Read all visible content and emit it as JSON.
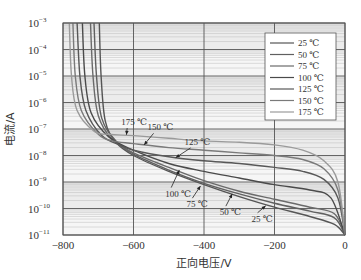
{
  "chart_data": {
    "type": "line",
    "title": "",
    "xlabel": "正向电压/V",
    "ylabel": "电流/A",
    "xlim": [
      -800,
      0
    ],
    "ylim": [
      1e-11,
      0.001
    ],
    "yscale": "log",
    "grid": true,
    "legend_position": "upper right",
    "x_ticks": [
      -800,
      -600,
      -400,
      -200,
      0
    ],
    "x_tick_labels": [
      "−800",
      "−600",
      "−400",
      "−200",
      "0"
    ],
    "y_ticks_exp": [
      -3,
      -4,
      -5,
      -6,
      -7,
      -8,
      -9,
      -10,
      -11
    ],
    "y_tick_base": "10",
    "series": [
      {
        "name": "25 ℃",
        "color": "#555555",
        "points": [
          [
            -697,
            -3
          ],
          [
            -692,
            -5
          ],
          [
            -680,
            -6.7
          ],
          [
            -650,
            -7.5
          ],
          [
            -600,
            -8.0
          ],
          [
            -500,
            -8.6
          ],
          [
            -400,
            -9.1
          ],
          [
            -300,
            -9.55
          ],
          [
            -200,
            -9.95
          ],
          [
            -100,
            -10.3
          ],
          [
            -30,
            -10.6
          ],
          [
            0,
            -11
          ]
        ]
      },
      {
        "name": "50 ℃",
        "color": "#606060",
        "points": [
          [
            -712,
            -3
          ],
          [
            -705,
            -5
          ],
          [
            -690,
            -6.6
          ],
          [
            -650,
            -7.45
          ],
          [
            -600,
            -7.95
          ],
          [
            -500,
            -8.55
          ],
          [
            -400,
            -9.05
          ],
          [
            -300,
            -9.45
          ],
          [
            -200,
            -9.8
          ],
          [
            -100,
            -10.1
          ],
          [
            -30,
            -10.35
          ],
          [
            0,
            -11
          ]
        ]
      },
      {
        "name": "75 ℃",
        "color": "#6a6a6a",
        "points": [
          [
            -722,
            -3
          ],
          [
            -715,
            -5
          ],
          [
            -700,
            -6.5
          ],
          [
            -660,
            -7.4
          ],
          [
            -600,
            -7.9
          ],
          [
            -500,
            -8.45
          ],
          [
            -400,
            -8.95
          ],
          [
            -300,
            -9.35
          ],
          [
            -200,
            -9.65
          ],
          [
            -100,
            -9.95
          ],
          [
            -30,
            -10.2
          ],
          [
            0,
            -11
          ]
        ]
      },
      {
        "name": "100 ℃",
        "color": "#4a4a4a",
        "points": [
          [
            -745,
            -3
          ],
          [
            -738,
            -5
          ],
          [
            -720,
            -6.4
          ],
          [
            -670,
            -7.3
          ],
          [
            -600,
            -7.8
          ],
          [
            -500,
            -8.3
          ],
          [
            -400,
            -8.6
          ],
          [
            -300,
            -8.85
          ],
          [
            -200,
            -9.1
          ],
          [
            -100,
            -9.3
          ],
          [
            -40,
            -9.6
          ],
          [
            0,
            -11
          ]
        ]
      },
      {
        "name": "125 ℃",
        "color": "#585858",
        "points": [
          [
            -760,
            -3
          ],
          [
            -752,
            -5
          ],
          [
            -735,
            -6.3
          ],
          [
            -690,
            -7.25
          ],
          [
            -640,
            -7.6
          ],
          [
            -600,
            -7.8
          ],
          [
            -500,
            -8.05
          ],
          [
            -400,
            -8.2
          ],
          [
            -300,
            -8.3
          ],
          [
            -200,
            -8.45
          ],
          [
            -120,
            -8.6
          ],
          [
            -60,
            -8.9
          ],
          [
            -20,
            -9.6
          ],
          [
            0,
            -11
          ]
        ]
      },
      {
        "name": "150 ℃",
        "color": "#7a7a7a",
        "points": [
          [
            -772,
            -3
          ],
          [
            -765,
            -5
          ],
          [
            -748,
            -6.3
          ],
          [
            -700,
            -7.2
          ],
          [
            -660,
            -7.45
          ],
          [
            -600,
            -7.55
          ],
          [
            -500,
            -7.7
          ],
          [
            -400,
            -7.8
          ],
          [
            -300,
            -7.9
          ],
          [
            -200,
            -8.0
          ],
          [
            -120,
            -8.15
          ],
          [
            -60,
            -8.5
          ],
          [
            -20,
            -9.3
          ],
          [
            0,
            -11
          ]
        ]
      },
      {
        "name": "175 ℃",
        "color": "#9a9a9a",
        "points": [
          [
            -782,
            -3
          ],
          [
            -776,
            -5
          ],
          [
            -760,
            -6.3
          ],
          [
            -710,
            -7.1
          ],
          [
            -670,
            -7.2
          ],
          [
            -600,
            -7.25
          ],
          [
            -500,
            -7.35
          ],
          [
            -400,
            -7.45
          ],
          [
            -300,
            -7.5
          ],
          [
            -200,
            -7.6
          ],
          [
            -120,
            -7.8
          ],
          [
            -60,
            -8.2
          ],
          [
            -20,
            -9.0
          ],
          [
            0,
            -11
          ]
        ]
      }
    ],
    "annotations": [
      {
        "text": "175 ℃",
        "label_xy": [
          -635,
          -6.85
        ],
        "arrow_to": [
          -620,
          -7.22
        ]
      },
      {
        "text": "150 ℃",
        "label_xy": [
          -560,
          -7.05
        ],
        "arrow_to": [
          -570,
          -7.6
        ]
      },
      {
        "text": "125 ℃",
        "label_xy": [
          -455,
          -7.6
        ],
        "arrow_to": [
          -480,
          -8.08
        ]
      },
      {
        "text": "100 ℃",
        "label_xy": [
          -510,
          -9.55
        ],
        "arrow_to": [
          -470,
          -8.55
        ]
      },
      {
        "text": "75 ℃",
        "label_xy": [
          -450,
          -9.95
        ],
        "arrow_to": [
          -410,
          -9.15
        ]
      },
      {
        "text": "50 ℃",
        "label_xy": [
          -355,
          -10.25
        ],
        "arrow_to": [
          -320,
          -9.45
        ]
      },
      {
        "text": "25 ℃",
        "label_xy": [
          -265,
          -10.5
        ],
        "arrow_to": [
          -225,
          -9.9
        ]
      }
    ]
  },
  "axes": {
    "xlabel": "正向电压/V",
    "ylabel": "电流/A"
  },
  "legend": {
    "entries": [
      "25 ℃",
      "50 ℃",
      "75 ℃",
      "100 ℃",
      "125 ℃",
      "150 ℃",
      "175 ℃"
    ]
  }
}
